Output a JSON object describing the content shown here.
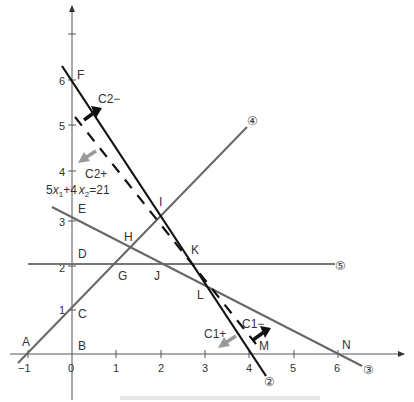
{
  "diagram": {
    "type": "linear-programming-feasible-region",
    "axes": {
      "x_ticks": [
        "−1",
        "0",
        "1",
        "2",
        "3",
        "4",
        "5",
        "6"
      ],
      "y_ticks": [
        "1",
        "2",
        "3",
        "4",
        "5",
        "6"
      ]
    },
    "points": [
      {
        "name": "A",
        "x": -1,
        "y": 0
      },
      {
        "name": "B",
        "x": 0,
        "y": 0
      },
      {
        "name": "C",
        "x": 0,
        "y": 1
      },
      {
        "name": "D",
        "x": 0,
        "y": 2
      },
      {
        "name": "E",
        "x": 0,
        "y": 3
      },
      {
        "name": "F",
        "x": 0,
        "y": 6
      },
      {
        "name": "G",
        "x": 1,
        "y": 2
      },
      {
        "name": "H",
        "x": 1.33,
        "y": 2.33
      },
      {
        "name": "I",
        "x": 2,
        "y": 3
      },
      {
        "name": "J",
        "x": 2,
        "y": 2
      },
      {
        "name": "K",
        "x": 2.67,
        "y": 2
      },
      {
        "name": "L",
        "x": 3,
        "y": 1.5
      },
      {
        "name": "M",
        "x": 4,
        "y": 0
      },
      {
        "name": "N",
        "x": 6,
        "y": 0
      }
    ],
    "lines": [
      {
        "id": "2",
        "label": "②",
        "desc": "solid black line through F(0,6) and (4,0)"
      },
      {
        "id": "3",
        "label": "③",
        "desc": "line through E(0,3) and N(6,0)"
      },
      {
        "id": "4",
        "label": "④",
        "desc": "line through A(−1,0) and C(0,1)"
      },
      {
        "id": "5",
        "label": "⑤",
        "desc": "horizontal line x2 = 2"
      },
      {
        "id": "dashed",
        "label": "5x₁+4x₂=21",
        "desc": "dashed objective line"
      }
    ],
    "annotations": {
      "c2_minus": "C2−",
      "c2_plus": "C2+",
      "c1_minus": "C1−",
      "c1_plus": "C1+",
      "equation_coef1": "5",
      "equation_var1": "x",
      "equation_sub1": "1",
      "equation_plus": "+4",
      "equation_var2": "x",
      "equation_sub2": "2",
      "equation_rhs": "=21"
    },
    "circled": {
      "two": "②",
      "three": "③",
      "four": "④",
      "five": "⑤"
    },
    "colors": {
      "axis": "#555555",
      "line_black": "#111111",
      "line_gray": "#666666",
      "arrow_black": "#111111",
      "arrow_gray": "#999999"
    }
  }
}
